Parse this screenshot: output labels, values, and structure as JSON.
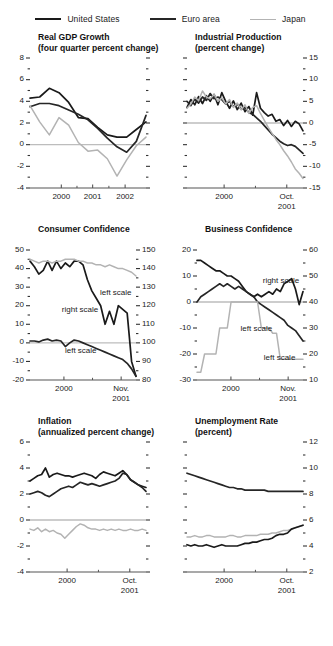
{
  "legend": {
    "items": [
      {
        "label": "United States",
        "color": "#1a1a1a",
        "key": "us"
      },
      {
        "label": "Euro area",
        "color": "#262626",
        "key": "ea"
      },
      {
        "label": "Japan",
        "color": "#b3b3b3",
        "key": "jp"
      }
    ]
  },
  "chart_data": [
    {
      "id": "real-gdp-growth",
      "type": "line",
      "title": "Real GDP Growth",
      "subtitle": "(four quarter percent change)",
      "ylabel": "",
      "xlabel": "",
      "ylim": [
        -4,
        8
      ],
      "yticks": [
        -4,
        -2,
        0,
        2,
        4,
        6,
        8
      ],
      "ytick_labels": [
        "-4",
        "-2",
        "0",
        "2",
        "4",
        "6",
        "8"
      ],
      "y_axis_side": "left",
      "zero_line": 0,
      "grid": false,
      "legend_position": "figure-top",
      "x": [
        "1999Q2",
        "1999Q3",
        "1999Q4",
        "2000Q1",
        "2000Q2",
        "2000Q3",
        "2000Q4",
        "2001Q1",
        "2001Q2",
        "2001Q3",
        "2001Q4",
        "2002Q1",
        "2002Q2"
      ],
      "xticks": [
        {
          "x": "2000",
          "label": "2000"
        },
        {
          "x": "2001",
          "label": "2001"
        },
        {
          "x": "2002",
          "label": "2002"
        }
      ],
      "series": [
        {
          "name": "United States",
          "color": "#1a1a1a",
          "values": [
            4.3,
            4.4,
            5.2,
            4.8,
            3.9,
            2.5,
            2.4,
            1.6,
            0.9,
            0.7,
            0.7,
            1.4,
            2.1
          ]
        },
        {
          "name": "Euro area",
          "color": "#262626",
          "values": [
            3.5,
            3.8,
            3.8,
            3.6,
            3.2,
            2.8,
            2.3,
            1.5,
            0.6,
            -0.2,
            -0.7,
            0.3,
            2.7
          ]
        },
        {
          "name": "Japan",
          "color": "#b3b3b3",
          "values": [
            3.6,
            2.1,
            0.9,
            2.5,
            1.8,
            0.2,
            -0.6,
            -0.5,
            -1.3,
            -2.9,
            -1.4,
            -0.1,
            0.7
          ]
        }
      ]
    },
    {
      "id": "industrial-production",
      "type": "line",
      "title": "Industrial Production",
      "subtitle": "(percent change)",
      "ylim": [
        -15,
        15
      ],
      "yticks": [
        -15,
        -10,
        -5,
        0,
        5,
        10,
        15
      ],
      "ytick_labels": [
        "-15",
        "-10",
        "-5",
        "0",
        "5",
        "10",
        "15"
      ],
      "y_axis_side": "right",
      "zero_line": 0,
      "grid": false,
      "xticks": [
        {
          "x": "2000",
          "label": "2000"
        },
        {
          "x": "Oct2001",
          "label": "Oct.",
          "label2": "2001"
        }
      ],
      "series": [
        {
          "name": "United States",
          "color": "#1a1a1a",
          "values": [
            3.6,
            5.4,
            4.2,
            6.1,
            4.5,
            6.3,
            5.0,
            6.6,
            4.2,
            7.0,
            5.0,
            3.4,
            5.1,
            3.1,
            4.6,
            2.6,
            3.8,
            1.8,
            7.0,
            3.4,
            2.4,
            1.6,
            2.0,
            0.4,
            0.8,
            -0.6,
            0.6,
            -0.8,
            0.4,
            -0.2,
            -1.8
          ]
        },
        {
          "name": "Euro area",
          "color": "#262626",
          "values": [
            5.0,
            4.0,
            5.5,
            4.6,
            6.0,
            5.2,
            6.8,
            5.6,
            6.0,
            5.4,
            4.4,
            5.0,
            3.8,
            4.4,
            3.2,
            3.6,
            2.4,
            2.0,
            1.2,
            0.4,
            -0.6,
            -1.6,
            -2.6,
            -3.4,
            -4.2,
            -4.8,
            -5.2,
            -5.0,
            -5.4,
            -6.2,
            -7.0
          ]
        },
        {
          "name": "Japan",
          "color": "#b3b3b3",
          "values": [
            3.4,
            4.4,
            6.0,
            5.2,
            7.4,
            6.0,
            5.6,
            6.6,
            5.0,
            5.8,
            4.4,
            5.4,
            3.6,
            4.6,
            3.0,
            4.2,
            2.2,
            3.6,
            4.0,
            2.2,
            0.6,
            -1.0,
            -2.4,
            -3.8,
            -5.0,
            -6.4,
            -7.6,
            -9.0,
            -10.6,
            -11.6,
            -12.8
          ]
        }
      ]
    },
    {
      "id": "consumer-confidence",
      "type": "line",
      "title": "Consumer Confidence",
      "subtitle": "",
      "ylim_left": [
        -20,
        50
      ],
      "ylim_right": [
        80,
        150
      ],
      "yticks_left": [
        -20,
        -10,
        0,
        10,
        20,
        30,
        40,
        50
      ],
      "ytick_labels_left": [
        "-20",
        "-10",
        "0",
        "10",
        "20",
        "30",
        "40",
        "50"
      ],
      "yticks_right": [
        80,
        90,
        100,
        110,
        120,
        130,
        140,
        150
      ],
      "ytick_labels_right": [
        "80",
        "90",
        "100",
        "110",
        "120",
        "130",
        "140",
        "150"
      ],
      "zero_line": 100,
      "grid": false,
      "annotations": [
        {
          "text": "right scale",
          "x_frac": 0.3,
          "y_frac": 0.42
        },
        {
          "text": "left scale",
          "x_frac": 0.66,
          "y_frac": 0.29
        },
        {
          "text": "left scale",
          "x_frac": 0.33,
          "y_frac": 0.74
        }
      ],
      "xticks": [
        {
          "x": "2000",
          "label": "2000"
        },
        {
          "x": "Nov2001",
          "label": "Nov.",
          "label2": "2001"
        }
      ],
      "series": [
        {
          "name": "United States",
          "scale": "right",
          "color": "#1a1a1a",
          "values": [
            144,
            141,
            137,
            139,
            144,
            139,
            144,
            140,
            143,
            141,
            144,
            144,
            142,
            134,
            128,
            124,
            120,
            110,
            117,
            110,
            120,
            118,
            116,
            90,
            82
          ]
        },
        {
          "name": "Euro area",
          "scale": "left",
          "color": "#262626",
          "values": [
            1,
            1,
            0.5,
            1.5,
            2,
            1,
            1.5,
            1,
            -2,
            0,
            1.5,
            1,
            0,
            -1,
            -2,
            -3,
            -4,
            -5,
            -6,
            -7,
            -8,
            -9,
            -11,
            -14,
            -18
          ]
        },
        {
          "name": "Japan",
          "scale": "right",
          "color": "#b3b3b3",
          "values": [
            145,
            144,
            143,
            144,
            144,
            143,
            144,
            144,
            145,
            145,
            145,
            144,
            144,
            143,
            143,
            142,
            142,
            141,
            142,
            141,
            140,
            140,
            139,
            138,
            136
          ]
        }
      ]
    },
    {
      "id": "business-confidence",
      "type": "line",
      "title": "Business Confidence",
      "subtitle": "",
      "ylim_left": [
        -30,
        20
      ],
      "ylim_right": [
        10,
        60
      ],
      "yticks_left": [
        -30,
        -20,
        -10,
        0,
        10,
        20
      ],
      "ytick_labels_left": [
        "-30",
        "-20",
        "-10",
        "0",
        "10",
        "20"
      ],
      "yticks_right": [
        10,
        20,
        30,
        40,
        50,
        60
      ],
      "ytick_labels_right": [
        "10",
        "20",
        "30",
        "40",
        "50",
        "60"
      ],
      "zero_line": 40,
      "grid": false,
      "annotations": [
        {
          "text": "right scale",
          "x_frac": 0.62,
          "y_frac": 0.2
        },
        {
          "text": "left scale",
          "x_frac": 0.4,
          "y_frac": 0.57,
          "wrap": true
        },
        {
          "text": "left scale",
          "x_frac": 0.63,
          "y_frac": 0.79
        }
      ],
      "xticks": [
        {
          "x": "2000",
          "label": "2000"
        },
        {
          "x": "Nov2001",
          "label": "Nov.",
          "label2": "2001"
        }
      ],
      "series": [
        {
          "name": "United States",
          "scale": "right",
          "color": "#1a1a1a",
          "values": [
            56,
            56,
            55,
            54,
            53,
            52,
            52,
            51,
            50,
            50,
            49,
            48,
            46,
            44,
            43,
            42,
            43,
            42,
            43,
            44,
            43,
            45,
            44,
            47,
            48,
            49,
            45,
            39,
            44
          ]
        },
        {
          "name": "Euro area",
          "scale": "right",
          "color": "#262626",
          "values": [
            40,
            42,
            43,
            44,
            45,
            46,
            47,
            46,
            47,
            46,
            45,
            46,
            45,
            44,
            43,
            42,
            40,
            39,
            38,
            37,
            36,
            35,
            34,
            33,
            31,
            30,
            29,
            27,
            25
          ]
        },
        {
          "name": "Japan",
          "scale": "left",
          "color": "#b3b3b3",
          "values": [
            -27,
            -27,
            -20,
            -20,
            -20,
            -20,
            -10,
            -10,
            -10,
            0,
            0,
            0,
            0,
            0,
            0,
            0,
            0,
            -10,
            -10,
            -10,
            -12,
            -12,
            -22,
            -22,
            -22,
            -22,
            -22,
            -22,
            -22
          ]
        }
      ]
    },
    {
      "id": "inflation",
      "type": "line",
      "title": "Inflation",
      "subtitle": "(annualized percent change)",
      "ylim": [
        -4,
        6
      ],
      "yticks": [
        -4,
        -2,
        0,
        2,
        4,
        6
      ],
      "ytick_labels": [
        "-4",
        "-2",
        "0",
        "2",
        "4",
        "6"
      ],
      "y_axis_side": "left",
      "zero_line": 0,
      "grid": false,
      "xticks": [
        {
          "x": "2000",
          "label": "2000"
        },
        {
          "x": "Oct2001",
          "label": "Oct.",
          "label2": "2001"
        }
      ],
      "series": [
        {
          "name": "United States",
          "color": "#1a1a1a",
          "values": [
            3.0,
            3.2,
            3.4,
            3.5,
            4.0,
            3.3,
            3.5,
            3.6,
            3.5,
            3.4,
            3.4,
            3.3,
            3.4,
            3.5,
            3.6,
            3.5,
            3.4,
            3.2,
            3.5,
            3.7,
            3.6,
            3.5,
            3.4,
            3.6,
            3.8,
            3.5,
            3.1,
            2.9,
            2.7,
            2.6,
            2.5
          ]
        },
        {
          "name": "Euro area",
          "color": "#262626",
          "values": [
            2.0,
            2.1,
            2.2,
            2.1,
            1.9,
            1.8,
            2.0,
            2.2,
            2.4,
            2.5,
            2.6,
            2.5,
            2.7,
            2.9,
            2.8,
            2.7,
            2.8,
            2.7,
            2.6,
            2.7,
            2.8,
            2.9,
            3.0,
            3.2,
            3.6,
            3.5,
            3.1,
            2.9,
            2.7,
            2.5,
            2.2
          ]
        },
        {
          "name": "Japan",
          "color": "#b3b3b3",
          "values": [
            -0.7,
            -0.8,
            -0.6,
            -0.9,
            -0.7,
            -0.9,
            -0.8,
            -1.0,
            -1.1,
            -1.4,
            -1.1,
            -0.8,
            -0.5,
            -0.3,
            -0.4,
            -0.6,
            -0.7,
            -0.7,
            -0.8,
            -0.7,
            -0.8,
            -0.7,
            -0.8,
            -0.7,
            -0.8,
            -0.8,
            -0.7,
            -0.8,
            -0.8,
            -0.7,
            -0.8
          ]
        }
      ]
    },
    {
      "id": "unemployment-rate",
      "type": "line",
      "title": "Unemployment Rate",
      "subtitle": "(percent)",
      "ylim": [
        2,
        12
      ],
      "yticks": [
        2,
        4,
        6,
        8,
        10,
        12
      ],
      "ytick_labels": [
        "2",
        "4",
        "6",
        "8",
        "10",
        "12"
      ],
      "y_axis_side": "right",
      "grid": false,
      "xticks": [
        {
          "x": "2000",
          "label": "2000"
        },
        {
          "x": "Oct2001",
          "label": "Oct.",
          "label2": "2001"
        }
      ],
      "series": [
        {
          "name": "Euro area",
          "color": "#262626",
          "values": [
            9.6,
            9.5,
            9.4,
            9.3,
            9.2,
            9.1,
            9.0,
            8.9,
            8.8,
            8.7,
            8.6,
            8.5,
            8.5,
            8.4,
            8.4,
            8.3,
            8.3,
            8.3,
            8.3,
            8.3,
            8.3,
            8.2,
            8.2,
            8.2,
            8.2,
            8.2,
            8.2,
            8.2,
            8.2,
            8.2,
            8.2
          ]
        },
        {
          "name": "Japan",
          "color": "#b3b3b3",
          "values": [
            4.7,
            4.7,
            4.8,
            4.7,
            4.7,
            4.8,
            4.8,
            4.7,
            4.7,
            4.7,
            4.7,
            4.8,
            4.8,
            4.7,
            4.7,
            4.8,
            4.8,
            4.8,
            4.8,
            4.9,
            4.9,
            4.9,
            5.0,
            5.0,
            5.1,
            5.2,
            5.2,
            5.3,
            5.4,
            5.5,
            5.6
          ]
        },
        {
          "name": "United States",
          "color": "#1a1a1a",
          "values": [
            4.1,
            4.0,
            4.1,
            4.0,
            4.0,
            4.1,
            4.0,
            3.9,
            4.0,
            4.1,
            4.0,
            4.0,
            4.0,
            4.0,
            4.1,
            4.2,
            4.2,
            4.3,
            4.3,
            4.4,
            4.5,
            4.5,
            4.6,
            4.8,
            4.9,
            4.9,
            5.0,
            5.3,
            5.4,
            5.5,
            5.6
          ]
        }
      ]
    }
  ]
}
